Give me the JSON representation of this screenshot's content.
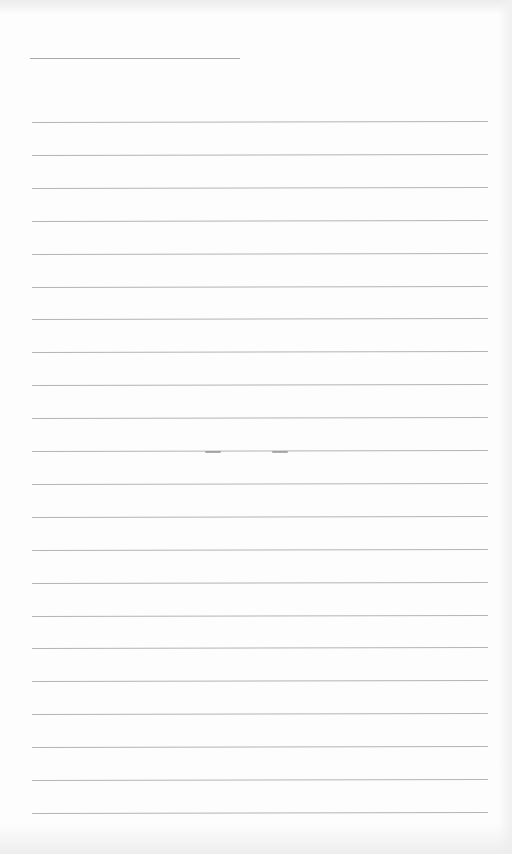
{
  "document": {
    "type": "lined-paper",
    "text": "",
    "colors": {
      "paper": "#fdfdfd",
      "rule": "#b4b4b4"
    }
  },
  "header_line": {
    "x": 30,
    "y": 58,
    "width": 210
  },
  "rules": {
    "count": 22,
    "first_y": 122,
    "spacing": 32.9,
    "x": 32,
    "width": 456
  },
  "smudges": [
    {
      "x": 205,
      "y": 451
    },
    {
      "x": 272,
      "y": 451
    }
  ]
}
